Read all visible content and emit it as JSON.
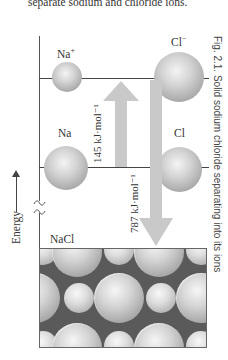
{
  "intro_text": "separate sodium and chloride ions.",
  "caption": "Fig. 2.1. Solid sodium chloride separating into its ions",
  "axis": {
    "label": "Energy",
    "direction": "up"
  },
  "levels": [
    {
      "name": "ions",
      "left_species": {
        "symbol": "Na",
        "charge": "+"
      },
      "right_species": {
        "symbol": "Cl",
        "charge": "−"
      }
    },
    {
      "name": "atoms",
      "left_species": {
        "symbol": "Na",
        "charge": ""
      },
      "right_species": {
        "symbol": "Cl",
        "charge": ""
      }
    },
    {
      "name": "solid",
      "label": "NaCl"
    }
  ],
  "arrows": [
    {
      "label": "145 kJ·mol⁻¹",
      "from": "atoms",
      "to": "ions",
      "direction": "up",
      "color": "#c8c8c8"
    },
    {
      "label": "787 kJ·mol⁻¹",
      "from": "ions",
      "to": "solid",
      "direction": "down",
      "color": "#c8c8c8"
    }
  ],
  "colors": {
    "sphere": "#b4b4b4",
    "arrow": "#c8c8c8",
    "lattice_bg": "#5a5a5a",
    "line": "#444444"
  }
}
